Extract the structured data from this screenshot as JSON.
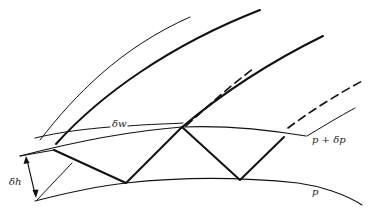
{
  "figure": {
    "labels": {
      "delta_w": "δw",
      "delta_h": "δh",
      "p_plus_dp": "p + δp",
      "p": "p"
    },
    "colors": {
      "line": "#111111",
      "background": "#ffffff"
    }
  }
}
